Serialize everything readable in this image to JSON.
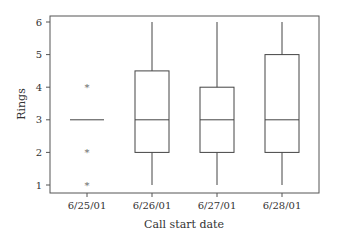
{
  "chart_data": {
    "type": "box",
    "title": "",
    "xlabel": "Call start date",
    "ylabel": "Rings",
    "ylim": [
      0.8,
      6.2
    ],
    "yticks": [
      1,
      2,
      3,
      4,
      5,
      6
    ],
    "grid": false,
    "legend": null,
    "categories": [
      "6/25/01",
      "6/26/01",
      "6/27/01",
      "6/28/01"
    ],
    "boxes": [
      {
        "category": "6/25/01",
        "whisker_low": 3,
        "q1": 3,
        "median": 3,
        "q3": 3,
        "whisker_high": 3,
        "outliers": [
          4,
          2,
          1
        ]
      },
      {
        "category": "6/26/01",
        "whisker_low": 1,
        "q1": 2,
        "median": 3,
        "q3": 4.5,
        "whisker_high": 6,
        "outliers": []
      },
      {
        "category": "6/27/01",
        "whisker_low": 1,
        "q1": 2,
        "median": 3,
        "q3": 4,
        "whisker_high": 6,
        "outliers": []
      },
      {
        "category": "6/28/01",
        "whisker_low": 1,
        "q1": 2,
        "median": 3,
        "q3": 5,
        "whisker_high": 6,
        "outliers": []
      }
    ]
  },
  "colors": {
    "frame": "#555555",
    "box_stroke": "#444444",
    "outlier": "#666666",
    "text": "#333333"
  }
}
